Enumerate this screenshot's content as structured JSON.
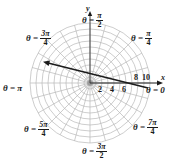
{
  "diagram": {
    "type": "polar-coordinate-grid",
    "origin_px": [
      90,
      83
    ],
    "unit_px": 6,
    "max_radius": 10,
    "circles_r": [
      1,
      2,
      3,
      4,
      5,
      6,
      7,
      8,
      9,
      10
    ],
    "radial_step_deg": 15,
    "colors": {
      "grid": "#b8b8b8",
      "ink": "#1a1a1a"
    },
    "axes": {
      "x_label": "x",
      "y_label": "y"
    },
    "radius_ticks": [
      "2",
      "4",
      "6",
      "8",
      "10"
    ],
    "angle_labels": [
      {
        "id": "pi-over-2",
        "prefix": "θ = ",
        "num": "π",
        "den": "2"
      },
      {
        "id": "pi-over-4",
        "prefix": "θ = ",
        "num": "π",
        "den": "4"
      },
      {
        "id": "3pi-over-4",
        "prefix": "θ = ",
        "num": "3π",
        "den": "4"
      },
      {
        "id": "pi",
        "text": "θ = π"
      },
      {
        "id": "zero",
        "text": "θ = 0"
      },
      {
        "id": "5pi-over-4",
        "prefix": "θ = ",
        "num": "5π",
        "den": "4"
      },
      {
        "id": "7pi-over-4",
        "prefix": "θ = ",
        "num": "7π",
        "den": "4"
      },
      {
        "id": "3pi-over-2",
        "prefix": "θ = ",
        "num": "3π",
        "den": "2"
      }
    ],
    "arrow": {
      "from_px": [
        148,
        88
      ],
      "to_px": [
        45,
        62
      ],
      "description": "ray drawn across grid pointing toward upper left (θ ≈ 165°)"
    }
  }
}
